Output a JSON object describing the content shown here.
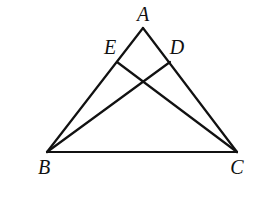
{
  "diagram": {
    "type": "geometry-triangle",
    "stroke_color": "#111111",
    "points": {
      "A": {
        "label": "A",
        "x": 143,
        "y": 28,
        "lx": 143,
        "ly": 21
      },
      "B": {
        "label": "B",
        "x": 47,
        "y": 152,
        "lx": 44,
        "ly": 174
      },
      "C": {
        "label": "C",
        "x": 237,
        "y": 152,
        "lx": 237,
        "ly": 174
      },
      "D": {
        "label": "D",
        "x": 170,
        "y": 62,
        "lx": 177,
        "ly": 54
      },
      "E": {
        "label": "E",
        "x": 117,
        "y": 62,
        "lx": 110,
        "ly": 54
      }
    },
    "segments": [
      {
        "from": "A",
        "to": "B",
        "name": "side-AB"
      },
      {
        "from": "A",
        "to": "C",
        "name": "side-AC"
      },
      {
        "from": "B",
        "to": "C",
        "name": "side-BC"
      },
      {
        "from": "B",
        "to": "D",
        "name": "segment-BD"
      },
      {
        "from": "C",
        "to": "E",
        "name": "segment-CE"
      }
    ]
  }
}
